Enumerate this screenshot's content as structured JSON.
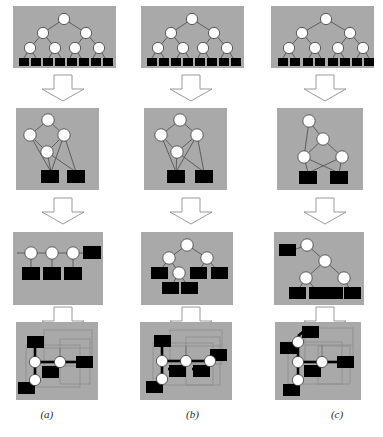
{
  "figure": {
    "title": "",
    "background_color": "#ffffff",
    "panel_fill": "#a9a9a9",
    "node_fill": "#ffffff",
    "node_stroke": "#3c3c3c",
    "leaf_fill": "#000000",
    "edge_color": "#555555",
    "arrow_fill": "#ffffff",
    "arrow_stroke": "#9a9a9a",
    "grid_color": "#8f8f8f",
    "columns": [
      {
        "id": "a",
        "caption": "(a)",
        "stages": [
          {
            "name": "stage-1-balanced-tree",
            "description": "Balanced binary tree over 8 leaves",
            "circle_nodes": 7,
            "square_leaves": 8,
            "levels": 3
          },
          {
            "name": "stage-2-contracted-graph",
            "description": "Contracted graph, 4 circle nodes, 2 square leaves",
            "circle_nodes": 4,
            "square_leaves": 2
          },
          {
            "name": "stage-3-chain-graph",
            "description": "Horizontal chain, 3 circle nodes, 4 square leaves",
            "circle_nodes": 3,
            "square_leaves": 4
          },
          {
            "name": "stage-4-embedded-layout",
            "description": "Embedded layout on grid with 3 circle nodes, 4 square leaves",
            "circle_nodes": 3,
            "square_leaves": 4
          }
        ]
      },
      {
        "id": "b",
        "caption": "(b)",
        "stages": [
          {
            "name": "stage-1-balanced-tree",
            "description": "Balanced binary tree over 8 leaves",
            "circle_nodes": 7,
            "square_leaves": 8,
            "levels": 3
          },
          {
            "name": "stage-2-contracted-graph",
            "description": "Contracted graph, 4 circle nodes, 2 square leaves",
            "circle_nodes": 4,
            "square_leaves": 2
          },
          {
            "name": "stage-3-chain-graph",
            "description": "Tree with 4 circle nodes and 5 square leaves",
            "circle_nodes": 4,
            "square_leaves": 5
          },
          {
            "name": "stage-4-embedded-layout",
            "description": "Embedded layout on grid with 4 circle nodes, 5 square leaves",
            "circle_nodes": 4,
            "square_leaves": 5
          }
        ]
      },
      {
        "id": "c",
        "caption": "(c)",
        "stages": [
          {
            "name": "stage-1-balanced-tree",
            "description": "Balanced binary tree over 8 leaves",
            "circle_nodes": 7,
            "square_leaves": 8,
            "levels": 3
          },
          {
            "name": "stage-2-contracted-graph",
            "description": "Contracted graph, 4 circle nodes, 2 square leaves, crossing edges",
            "circle_nodes": 4,
            "square_leaves": 2
          },
          {
            "name": "stage-3-chain-graph",
            "description": "Tree with 4 circle nodes and 5 square leaves",
            "circle_nodes": 4,
            "square_leaves": 5
          },
          {
            "name": "stage-4-embedded-layout",
            "description": "Embedded layout on grid with 4 circle nodes, 5 square leaves",
            "circle_nodes": 4,
            "square_leaves": 5
          }
        ]
      }
    ],
    "arrows": {
      "count_per_column": 3,
      "direction": "down",
      "style": "hollow-block-arrow"
    }
  }
}
